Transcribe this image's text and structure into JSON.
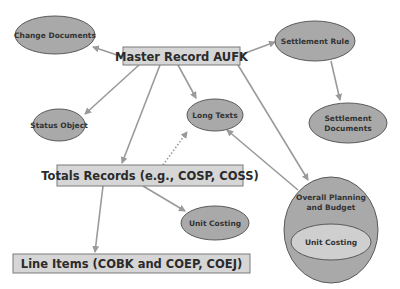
{
  "diagram": {
    "nodes": {
      "master_record": {
        "label": "Master Record AUFK",
        "shape": "box"
      },
      "change_documents": {
        "label": "Change Documents",
        "shape": "ellipse"
      },
      "settlement_rule": {
        "label": "Settlement Rule",
        "shape": "ellipse"
      },
      "settlement_documents": {
        "label_line1": "Settlement",
        "label_line2": "Documents",
        "shape": "ellipse"
      },
      "status_object": {
        "label": "Status Object",
        "shape": "ellipse"
      },
      "long_texts": {
        "label": "Long Texts",
        "shape": "ellipse"
      },
      "totals_records": {
        "label": "Totals Records (e.g., COSP, COSS)",
        "shape": "box"
      },
      "unit_costing": {
        "label": "Unit Costing",
        "shape": "ellipse"
      },
      "overall_planning": {
        "label_line1": "Overall Planning",
        "label_line2": "and Budget",
        "shape": "circle"
      },
      "overall_unit_costing": {
        "label": "Unit Costing",
        "shape": "ellipse"
      },
      "line_items": {
        "label": "Line Items (COBK and COEP, COEJ)",
        "shape": "box"
      }
    },
    "edges": [
      {
        "from": "master_record",
        "to": "change_documents",
        "style": "solid"
      },
      {
        "from": "master_record",
        "to": "settlement_rule",
        "style": "solid"
      },
      {
        "from": "settlement_rule",
        "to": "settlement_documents",
        "style": "solid"
      },
      {
        "from": "master_record",
        "to": "status_object",
        "style": "solid"
      },
      {
        "from": "master_record",
        "to": "long_texts",
        "style": "solid"
      },
      {
        "from": "master_record",
        "to": "totals_records",
        "style": "solid"
      },
      {
        "from": "master_record",
        "to": "overall_planning",
        "style": "solid"
      },
      {
        "from": "totals_records",
        "to": "long_texts",
        "style": "dotted"
      },
      {
        "from": "overall_planning",
        "to": "long_texts",
        "style": "solid"
      },
      {
        "from": "totals_records",
        "to": "unit_costing",
        "style": "solid"
      },
      {
        "from": "totals_records",
        "to": "line_items",
        "style": "solid"
      }
    ],
    "colors": {
      "node_fill": "#a9a9a9",
      "box_fill": "#d6d6d6",
      "edge": "#9a9a9a"
    }
  }
}
